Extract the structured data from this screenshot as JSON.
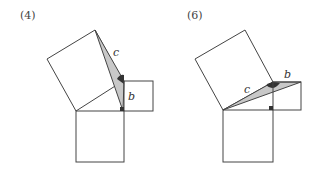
{
  "figures": [
    {
      "label": "(4)",
      "side_c_label": "c",
      "side_b_label": "b"
    },
    {
      "label": "(6)",
      "side_c_label": "c",
      "side_b_label": "b"
    }
  ],
  "colors": {
    "stroke": "#444444",
    "shade": "#c8c8c8",
    "angle_mark": "#333333",
    "background": "#ffffff"
  }
}
